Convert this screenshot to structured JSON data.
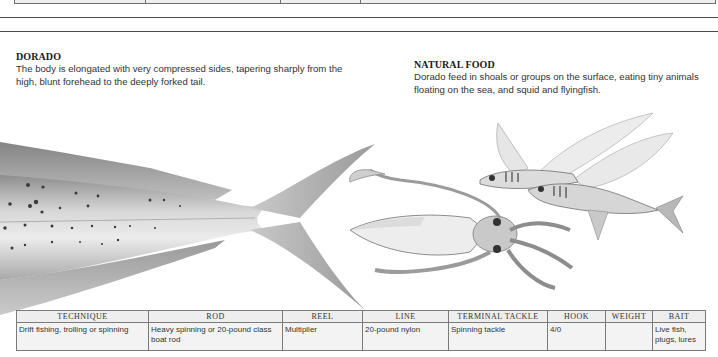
{
  "dorado": {
    "title": "DORADO",
    "body": "The body is elongated with very compressed sides, tapering sharply from the high, blunt forehead to the deeply forked tail."
  },
  "natural_food": {
    "title": "NATURAL FOOD",
    "body": "Dorado feed in shoals or groups on the surface, eating tiny animals floating on the sea, and squid and flyingfish."
  },
  "illustrations": {
    "fish": "dorado-tail-illustration",
    "squid": "squid-illustration",
    "flyingfish": "flyingfish-illustration"
  },
  "tackle_table": {
    "headers": [
      "TECHNIQUE",
      "ROD",
      "REEL",
      "LINE",
      "TERMINAL TACKLE",
      "HOOK",
      "WEIGHT",
      "BAIT"
    ],
    "rows": [
      [
        "Drift fishing, trolling or spinning",
        "Heavy spinning or 20-pound class boat rod",
        "Multiplier",
        "20-pound nylon",
        "Spinning tackle",
        "4/0",
        "",
        "Live fish, plugs, lures"
      ]
    ]
  },
  "colors": {
    "table_header_bg": "#eeeeee",
    "table_cell_bg": "#f3f3f3",
    "table_border": "#7b7b7b",
    "rule": "#4a4a4a"
  }
}
